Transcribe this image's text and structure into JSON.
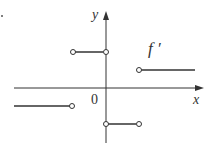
{
  "figure": {
    "x_axis_label": "x",
    "y_axis_label": "y",
    "origin_label": "0",
    "function_label": "f ′",
    "line_color": "#333333"
  },
  "segments": [
    {
      "name": "left",
      "y_level": "negative",
      "left_end": "extends",
      "right_end": "open"
    },
    {
      "name": "upper-middle",
      "y_level": "high positive",
      "left_end": "open",
      "right_end": "open"
    },
    {
      "name": "lower-middle",
      "y_level": "negative",
      "left_end": "open",
      "right_end": "open"
    },
    {
      "name": "right",
      "y_level": "positive",
      "left_end": "open",
      "right_end": "extends"
    }
  ]
}
